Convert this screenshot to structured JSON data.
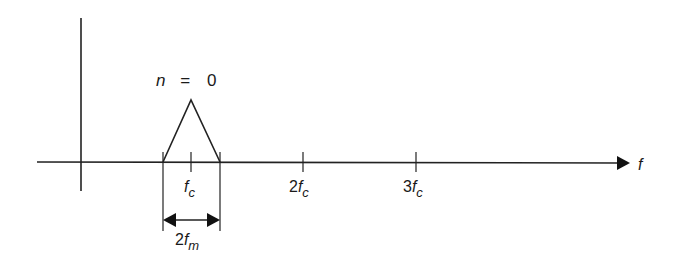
{
  "diagram": {
    "type": "frequency spectrum",
    "axis_label": "f",
    "peak_label": {
      "n": "n",
      "eq": "=",
      "value": "0"
    },
    "ticks": [
      {
        "coef": "",
        "sym": "f",
        "sub": "c"
      },
      {
        "coef": "2",
        "sym": "f",
        "sub": "c"
      },
      {
        "coef": "3",
        "sym": "f",
        "sub": "c"
      }
    ],
    "bandwidth_label": {
      "coef": "2",
      "sym": "f",
      "sub": "m"
    },
    "line_color": "#1a1a1a"
  }
}
